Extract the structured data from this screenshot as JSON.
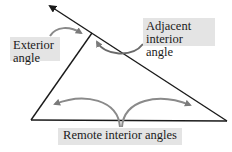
{
  "diagram": {
    "labels": {
      "exterior": [
        "Exterior",
        "angle"
      ],
      "adjacent": [
        "Adjacent",
        "interior angle"
      ],
      "remote": "Remote interior angles"
    },
    "colors": {
      "line": "#1a1a1a",
      "arrow": "#7a7a7a",
      "label_bg": "#e4e4e4",
      "text": "#1a1a1a"
    },
    "vertices": {
      "apex": [
        92,
        33
      ],
      "bottom_left": [
        31,
        120
      ],
      "bottom_right": [
        227,
        121
      ],
      "extension_tip": [
        48,
        5
      ]
    }
  }
}
